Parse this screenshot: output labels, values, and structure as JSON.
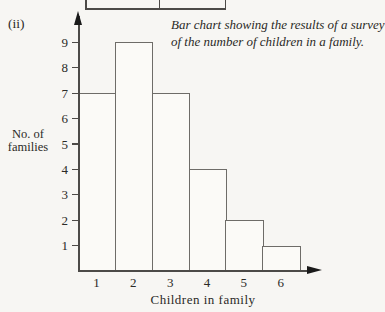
{
  "page": {
    "figure_label": "(ii)",
    "caption_line1": "Bar chart showing the results of a survey",
    "caption_line2": "of the number of children in a family.",
    "y_axis_title_line1": "No. of",
    "y_axis_title_line2": "families",
    "x_axis_title": "Children in family"
  },
  "chart_data": {
    "type": "bar",
    "title": "Bar chart showing the results of a survey of the number of children in a family.",
    "xlabel": "Children in family",
    "ylabel": "No. of families",
    "categories": [
      "1",
      "2",
      "3",
      "4",
      "5",
      "6"
    ],
    "values": [
      7,
      9,
      7,
      4,
      2,
      1
    ],
    "y_ticks": [
      1,
      2,
      3,
      4,
      5,
      6,
      7,
      8,
      9
    ],
    "ylim": [
      0,
      9.5
    ],
    "bar_gap": 0,
    "grid": "off",
    "legend": "none",
    "style": "outline-only contiguous bars, scanned textbook figure with axis arrowheads"
  },
  "decor": {
    "previous_figure_remnant": "bottom edge of a box from the figure above, with two cell dividers"
  },
  "colors": {
    "background": "#f7f6f3",
    "line": "#4c4a47",
    "bar_outline": "#6e6c68",
    "bar_fill": "#fbfaf7",
    "text": "#2b2a27",
    "arrow": "#1a1a1a"
  }
}
